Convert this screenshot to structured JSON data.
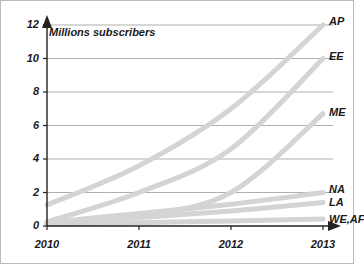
{
  "chart_data": {
    "type": "line",
    "title": "",
    "subtitle": "",
    "ylabel": "Millions subscribers",
    "xlabel": "",
    "x": [
      2010,
      2011,
      2012,
      2013
    ],
    "xtick_labels": [
      "2010",
      "2011",
      "2012",
      "2013"
    ],
    "ytick_labels": [
      "0",
      "2",
      "4",
      "6",
      "8",
      "10",
      "12"
    ],
    "yticks": [
      0,
      2,
      4,
      6,
      8,
      10,
      12
    ],
    "ylim": [
      0,
      12
    ],
    "xlim": [
      2010,
      2013
    ],
    "grid": "horizontal",
    "legend": "right-inline-labels",
    "line_color": "#d4d4d4",
    "line_width": 5,
    "series": [
      {
        "name": "AP",
        "label": "AP",
        "values": [
          1.25,
          3.6,
          7.0,
          12.0
        ]
      },
      {
        "name": "EE",
        "label": "EE",
        "values": [
          0.25,
          2.0,
          4.6,
          10.0
        ]
      },
      {
        "name": "ME",
        "label": "ME",
        "values": [
          0.1,
          0.6,
          2.0,
          6.7
        ]
      },
      {
        "name": "NA",
        "label": "NA",
        "values": [
          0.2,
          0.75,
          1.3,
          2.0
        ]
      },
      {
        "name": "LA",
        "label": "LA",
        "values": [
          0.15,
          0.5,
          0.9,
          1.4
        ]
      },
      {
        "name": "WE,AF",
        "label": "WE,AF",
        "values": [
          0.1,
          0.2,
          0.3,
          0.42
        ]
      }
    ]
  },
  "axes": {
    "y_arrow": "up-arrow-icon",
    "x_arrow": "right-arrow-icon"
  }
}
